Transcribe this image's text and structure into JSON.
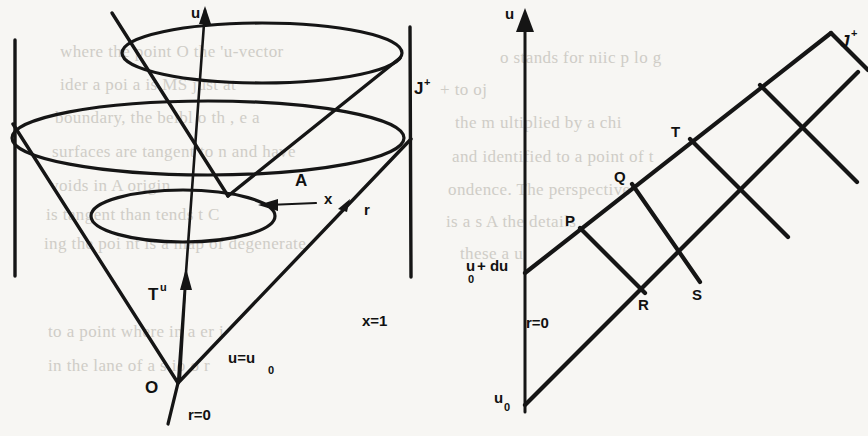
{
  "figure": {
    "caption_present": false,
    "panels": [
      {
        "id": "left-panel",
        "name": "light-cone-diagram",
        "description": "Expanding light cone with three circular cross-sections between two vertical scri lines",
        "labels": {
          "u_axis": "u",
          "scri_plus": "J",
          "scri_plus_sup": "+",
          "area_A": "A",
          "x_vector": "x",
          "r_vector": "r",
          "tangent": "T",
          "tangent_sup": "u",
          "origin": "O",
          "r_zero": "r=0",
          "u_equals": "u=u",
          "u_equals_sub": "0",
          "x_equals_one": "x=1"
        }
      },
      {
        "id": "right-panel",
        "name": "penrose-diamond-diagram",
        "description": "Conformal diagram with two parallel null rays from r=0 axis crossed by perpendicular null rays forming a chain of diamonds",
        "labels": {
          "u_axis": "u",
          "scri_plus": "J",
          "scri_plus_sup": "+",
          "r_zero": "r=0",
          "u_zero": "u",
          "u_zero_sub": "0",
          "u_zero_plus_du": "+ du",
          "point_P": "P",
          "point_Q": "Q",
          "point_T": "T",
          "point_R": "R",
          "point_S": "S"
        }
      }
    ]
  },
  "chart_data": {
    "type": "diagram",
    "title": "",
    "left_diagram": {
      "type": "light-cone",
      "apex": {
        "x": 178,
        "y": 383,
        "label": "O"
      },
      "cone_half_angle_note": "opening cone from apex O upward",
      "cross_sections": [
        {
          "name": "lower-circle",
          "cx": 183,
          "cy": 216,
          "rx": 92,
          "ry": 26
        },
        {
          "name": "middle-circle",
          "cx": 208,
          "cy": 138,
          "rx": 196,
          "ry": 36
        },
        {
          "name": "upper-circle",
          "cx": 262,
          "cy": 53,
          "rx": 140,
          "ry": 30
        }
      ],
      "vertical_lines": [
        {
          "name": "left-scri",
          "x": 15,
          "y1": 40,
          "y2": 276
        },
        {
          "name": "right-scri",
          "x": 410,
          "y1": 27,
          "y2": 277
        }
      ],
      "annotations": [
        "u",
        "J+",
        "A",
        "x",
        "r",
        "T^u",
        "O",
        "r=0",
        "u=u_0",
        "x=1"
      ]
    },
    "right_diagram": {
      "type": "penrose-conformal",
      "axis": {
        "name": "u-axis",
        "x": 525,
        "y_bottom": 412,
        "y_top": 14,
        "label": "u"
      },
      "null_rays": [
        {
          "name": "lower-null-ray",
          "from": {
            "x": 525,
            "y": 405,
            "label": "u_0"
          },
          "to": {
            "x": 858,
            "y": 72
          }
        },
        {
          "name": "upper-null-ray",
          "from": {
            "x": 525,
            "y": 273,
            "label": "u_0 + du"
          },
          "to": {
            "x": 830,
            "y": 32
          }
        }
      ],
      "marked_points": [
        {
          "label": "P",
          "x": 580,
          "y": 228
        },
        {
          "label": "Q",
          "x": 630,
          "y": 186
        },
        {
          "label": "T",
          "x": 688,
          "y": 140
        },
        {
          "label": "R",
          "x": 640,
          "y": 290
        },
        {
          "label": "S",
          "x": 697,
          "y": 282
        }
      ],
      "scri_label": "J+",
      "r_zero_label": "r=0",
      "annotations": [
        "u",
        "J+",
        "r=0",
        "u_0",
        "u_0 + du",
        "P",
        "Q",
        "T",
        "R",
        "S"
      ]
    }
  },
  "background_text": {
    "note": "faint show-through of printed text from the opposite page",
    "lines": [
      {
        "text": "where    the point  O  the  'u-vector",
        "x": 60,
        "y": 42
      },
      {
        "text": "ider  a   poi   a    is  MS  just  at",
        "x": 60,
        "y": 75
      },
      {
        "text": "boundary, the beibl o  th       , e  a",
        "x": 55,
        "y": 108
      },
      {
        "text": "surfaces   are  tangent  to  n  and  have",
        "x": 52,
        "y": 142
      },
      {
        "text": "voids in   A   origin",
        "x": 50,
        "y": 176
      },
      {
        "text": "is  tangent  than  tends  t  C",
        "x": 46,
        "y": 205
      },
      {
        "text": "ing   the  poi   nt  is  a  map  of   degenerate",
        "x": 44,
        "y": 234
      },
      {
        "text": "to  a   point   where   in   a    er  i",
        "x": 48,
        "y": 322
      },
      {
        "text": "in  the  lane   of  a      s   io  o   r",
        "x": 48,
        "y": 356
      },
      {
        "text": "o  stands  for   niic   p  lo  g",
        "x": 500,
        "y": 48
      },
      {
        "text": "+                 to                 oj",
        "x": 440,
        "y": 80
      },
      {
        "text": "the    m   ultiplied   by  a  chi",
        "x": 455,
        "y": 113
      },
      {
        "text": "and  identified   to  a  point  of   t",
        "x": 452,
        "y": 147
      },
      {
        "text": "ondence.   The  perspective",
        "x": 448,
        "y": 180
      },
      {
        "text": "is   a   s      A     the  details",
        "x": 446,
        "y": 212
      },
      {
        "text": "these     a     u",
        "x": 460,
        "y": 244
      }
    ]
  }
}
